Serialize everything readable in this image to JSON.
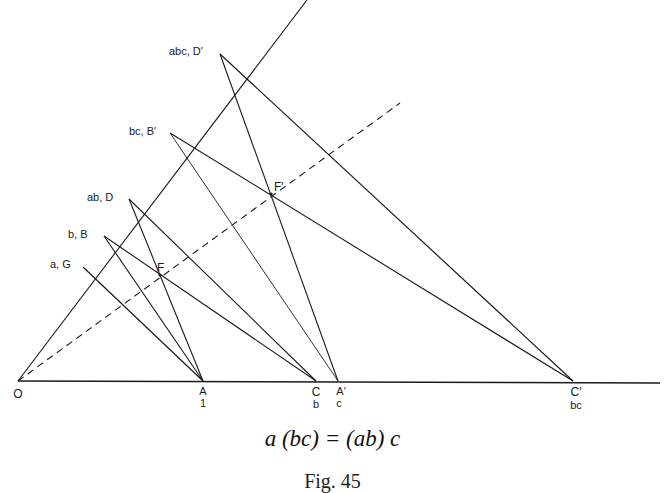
{
  "figure": {
    "equation": "a (bc) = (ab) c",
    "caption": "Fig. 45",
    "line_color": "#1a1a1a",
    "background": "#ffffff"
  },
  "points": {
    "O": {
      "label": "O",
      "x": 18,
      "y": 381
    },
    "A": {
      "label": "A",
      "sub": "1",
      "x": 203,
      "y": 381
    },
    "C": {
      "label": "C",
      "sub": "b",
      "x": 316,
      "y": 381
    },
    "A_prime": {
      "label": "A′",
      "sub": "c",
      "x": 338,
      "y": 381
    },
    "C_prime": {
      "label": "C′",
      "sub": "bc",
      "x": 573,
      "y": 381
    },
    "G": {
      "label": "a, G",
      "x": 83,
      "y": 267
    },
    "B": {
      "label": "b, B",
      "x": 104,
      "y": 236
    },
    "D": {
      "label": "ab, D",
      "x": 129,
      "y": 199
    },
    "B_prime": {
      "label": "bc, B′",
      "x": 170,
      "y": 133
    },
    "D_prime": {
      "label": "abc, D′",
      "x": 220,
      "y": 54
    },
    "F": {
      "label": "F",
      "x": 160,
      "y": 275
    },
    "F_prime": {
      "label": "F′",
      "x": 271,
      "y": 194
    }
  },
  "lines": {
    "baseline": {
      "from": [
        18,
        381
      ],
      "to": [
        660,
        383
      ]
    },
    "oblique_axis": {
      "from": [
        18,
        381
      ],
      "to": [
        307,
        0
      ]
    },
    "dashed_axis": {
      "from": [
        18,
        381
      ],
      "to": [
        400,
        103
      ]
    }
  },
  "segments": [
    {
      "name": "G-A",
      "from": "G",
      "to": "A"
    },
    {
      "name": "B-A",
      "from": "B",
      "to": "A"
    },
    {
      "name": "B-C",
      "from": "B",
      "to": "C"
    },
    {
      "name": "D-A",
      "from": "D",
      "to": "A"
    },
    {
      "name": "D-C",
      "from": "D",
      "to": "C"
    },
    {
      "name": "B'-A'",
      "from": "B_prime",
      "to": "A_prime"
    },
    {
      "name": "B'-C'",
      "from": "B_prime",
      "to": "C_prime"
    },
    {
      "name": "D'-A'",
      "from": "D_prime",
      "to": "A_prime"
    },
    {
      "name": "D'-C'",
      "from": "D_prime",
      "to": "C_prime"
    }
  ]
}
